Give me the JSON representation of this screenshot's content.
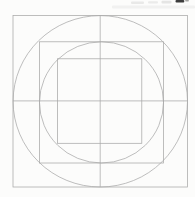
{
  "canvas": {
    "width": 195,
    "height": 197,
    "background": "#fcfcfb"
  },
  "figure": {
    "line_color": "#a8a8a8",
    "stroke_width": 0.75,
    "shapes": [
      {
        "type": "rect",
        "name": "outer-square",
        "x": 13,
        "y": 15.5,
        "w": 174.5,
        "h": 171.5
      },
      {
        "type": "ellipse",
        "name": "outer-circle",
        "cx": 100.3,
        "cy": 101.3,
        "rx": 87.2,
        "ry": 85.7
      },
      {
        "type": "rect",
        "name": "middle-square",
        "x": 39.5,
        "y": 41.8,
        "w": 124,
        "h": 121.2
      },
      {
        "type": "ellipse",
        "name": "middle-circle",
        "cx": 101.5,
        "cy": 102.4,
        "rx": 62,
        "ry": 60.6
      },
      {
        "type": "rect",
        "name": "inner-square",
        "x": 57.5,
        "y": 58.8,
        "w": 84.3,
        "h": 84.5
      },
      {
        "type": "line",
        "name": "horizontal-axis-line",
        "x1": 13,
        "y1": 100.9,
        "x2": 187.5,
        "y2": 100.9
      },
      {
        "type": "line",
        "name": "vertical-axis-line",
        "x1": 100.2,
        "y1": 15.5,
        "x2": 100.2,
        "y2": 187
      }
    ]
  },
  "artifacts": {
    "note": "illegible cut-off print fragments along top edge of scan",
    "marks": [
      {
        "name": "scan-streak",
        "x": 112,
        "y": 5.5,
        "w": 83,
        "h": 3,
        "color": "#efefee",
        "opacity": 0.9
      },
      {
        "name": "faint-text-smudge-1",
        "x": 131,
        "y": 1.5,
        "w": 13,
        "h": 2.4,
        "color": "#e7e7e6",
        "opacity": 0.9
      },
      {
        "name": "faint-text-smudge-2",
        "x": 148,
        "y": 1.2,
        "w": 10,
        "h": 2.4,
        "color": "#e9e9e8",
        "opacity": 0.9
      },
      {
        "name": "faint-text-smudge-3",
        "x": 161.5,
        "y": 0.8,
        "w": 10,
        "h": 2.6,
        "color": "#e2e2e1",
        "opacity": 0.9
      },
      {
        "name": "cropped-text-fragment",
        "x": 175.5,
        "y": 0,
        "w": 8.8,
        "h": 2.4,
        "color": "#3c3c3c",
        "opacity": 1
      },
      {
        "name": "cropped-text-fragment-tail",
        "x": 185,
        "y": 0,
        "w": 4,
        "h": 1.6,
        "color": "#9a9a98",
        "opacity": 0.9
      }
    ]
  }
}
